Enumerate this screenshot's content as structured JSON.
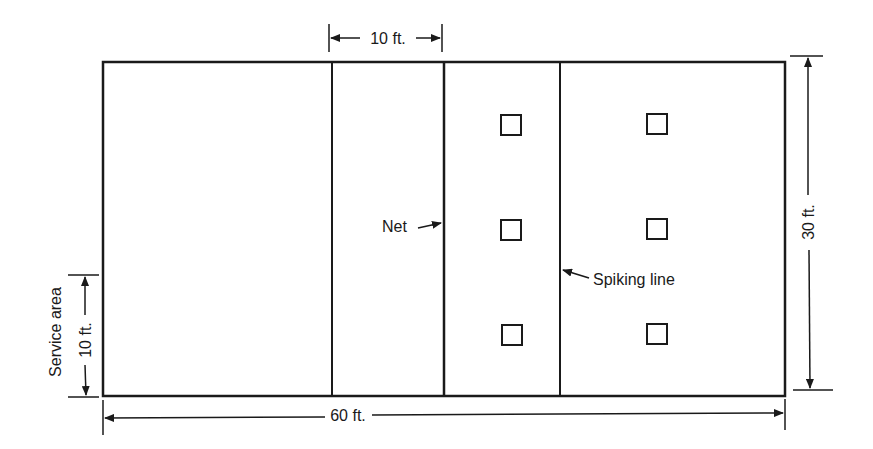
{
  "diagram": {
    "dimensions": {
      "width_label": "60 ft.",
      "height_label": "30 ft.",
      "zone_label": "10 ft.",
      "service_area_label": "Service area",
      "service_area_size_label": "10 ft."
    },
    "annotations": {
      "net": "Net",
      "spiking_line": "Spiking line"
    },
    "player_positions": [
      {
        "row": 1,
        "col": 1
      },
      {
        "row": 1,
        "col": 2
      },
      {
        "row": 2,
        "col": 1
      },
      {
        "row": 2,
        "col": 2
      },
      {
        "row": 3,
        "col": 1
      },
      {
        "row": 3,
        "col": 2
      }
    ],
    "colors": {
      "line": "#1a1a1a",
      "background": "#ffffff"
    }
  }
}
